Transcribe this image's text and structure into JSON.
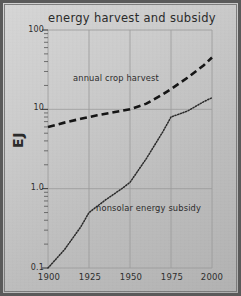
{
  "chart_data": {
    "type": "line",
    "title": "energy harvest and subsidy",
    "xlabel": "",
    "ylabel": "EJ",
    "yscale": "log",
    "ylim": [
      0.1,
      100
    ],
    "xlim": [
      1900,
      2000
    ],
    "grid": true,
    "legend_position": "inline-annotations",
    "x_ticks": [
      "1900",
      "1925",
      "1950",
      "1975",
      "2000"
    ],
    "y_ticks": [
      "100",
      "10",
      "1.0",
      "0.1"
    ],
    "series": [
      {
        "name": "annual crop harvest",
        "style": "dashed",
        "color": "#151515",
        "x": [
          1900,
          1910,
          1920,
          1930,
          1940,
          1950,
          1960,
          1970,
          1975,
          1985,
          1995,
          2000
        ],
        "values": [
          6.0,
          6.8,
          7.6,
          8.4,
          9.2,
          10.0,
          11.8,
          15.5,
          18.0,
          25.0,
          36.0,
          45.0
        ]
      },
      {
        "name": "nonsolar energy subsidy",
        "style": "dotted",
        "color": "#2a2a2a",
        "x": [
          1900,
          1910,
          1920,
          1925,
          1935,
          1945,
          1950,
          1960,
          1970,
          1975,
          1985,
          1995,
          2000
        ],
        "values": [
          0.1,
          0.17,
          0.33,
          0.5,
          0.72,
          1.0,
          1.2,
          2.4,
          5.2,
          8.0,
          9.5,
          12.5,
          14.0
        ]
      }
    ]
  },
  "annotations": {
    "harvest_label": "annual crop harvest",
    "subsidy_label": "nonsolar energy subsidy"
  },
  "axis": {
    "y_title": "EJ"
  }
}
